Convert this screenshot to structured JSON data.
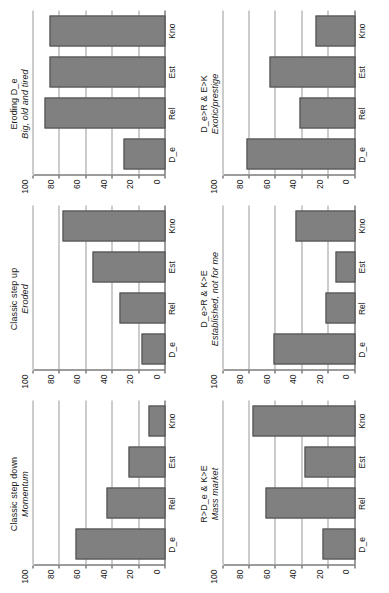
{
  "figure": {
    "orientation_degrees": -90,
    "grid_rows": 2,
    "grid_cols": 3,
    "bar_color": "#808080",
    "bar_border_color": "#4d4d4d",
    "axis_color": "#3a3a3a",
    "gridline_color": "#9a9a9a",
    "background": "#ffffff"
  },
  "chart_data": [
    {
      "id": "mass-market",
      "type": "bar",
      "title": "R>D_e & K>E",
      "subtitle": "Mass market",
      "categories": [
        "D_e",
        "Rel",
        "Est",
        "Kno"
      ],
      "values": [
        25,
        68,
        38,
        78
      ],
      "xlabel": "",
      "ylabel": "",
      "ylim": [
        0,
        100
      ],
      "yticks": [
        0,
        20,
        40,
        60,
        80,
        100
      ],
      "grid": true
    },
    {
      "id": "established-not-for-me",
      "type": "bar",
      "title": "D_e>R & K>E",
      "subtitle": "Established, not for me",
      "categories": [
        "D_e",
        "Rel",
        "Est",
        "Kno"
      ],
      "values": [
        62,
        22,
        15,
        45
      ],
      "xlabel": "",
      "ylabel": "",
      "ylim": [
        0,
        100
      ],
      "yticks": [
        0,
        20,
        40,
        60,
        80,
        100
      ],
      "grid": true
    },
    {
      "id": "exotic-prestige",
      "type": "bar",
      "title": "D_e>R & E>K",
      "subtitle": "Exotic/prestige",
      "categories": [
        "D_e",
        "Rel",
        "Est",
        "Kno"
      ],
      "values": [
        82,
        42,
        65,
        30
      ],
      "xlabel": "",
      "ylabel": "",
      "ylim": [
        0,
        100
      ],
      "yticks": [
        0,
        20,
        40,
        60,
        80,
        100
      ],
      "grid": true
    },
    {
      "id": "classic-step-down",
      "type": "bar",
      "title": "Classic step down",
      "subtitle": "Momentum",
      "categories": [
        "D_e",
        "Rel",
        "Est",
        "Kno"
      ],
      "values": [
        68,
        45,
        28,
        13
      ],
      "xlabel": "",
      "ylabel": "",
      "ylim": [
        0,
        100
      ],
      "yticks": [
        0,
        20,
        40,
        60,
        80,
        100
      ],
      "grid": true
    },
    {
      "id": "classic-step-up",
      "type": "bar",
      "title": "Classic step up",
      "subtitle": "Eroded",
      "categories": [
        "D_e",
        "Rel",
        "Est",
        "Kno"
      ],
      "values": [
        18,
        35,
        55,
        78
      ],
      "xlabel": "",
      "ylabel": "",
      "ylim": [
        0,
        100
      ],
      "yticks": [
        0,
        20,
        40,
        60,
        80,
        100
      ],
      "grid": true
    },
    {
      "id": "eroding-d-e",
      "type": "bar",
      "title": "Eroding D_e",
      "subtitle": "Big, old and tired",
      "categories": [
        "D_e",
        "Rel",
        "Est",
        "Kno"
      ],
      "values": [
        32,
        92,
        88,
        88
      ],
      "xlabel": "",
      "ylabel": "",
      "ylim": [
        0,
        100
      ],
      "yticks": [
        0,
        20,
        40,
        60,
        80,
        100
      ],
      "grid": true
    }
  ],
  "panel_order": [
    "classic-step-down",
    "classic-step-up",
    "eroding-d-e",
    "mass-market",
    "established-not-for-me",
    "exotic-prestige"
  ]
}
